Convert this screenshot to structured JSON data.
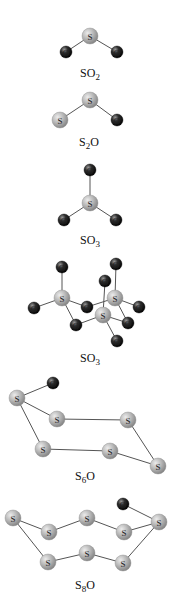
{
  "figure": {
    "width": 171,
    "height": 597,
    "background": "#ffffff",
    "colors": {
      "sulfur_fill": "#b4b4b4",
      "sulfur_highlight": "#e6e6e6",
      "sulfur_shadow": "#8a8a8a",
      "oxygen_fill": "#2a2a2a",
      "oxygen_highlight": "#8a8a8a",
      "oxygen_shadow": "#0a0a0a",
      "bond": "#555555",
      "text": "#111111"
    },
    "atom_radius": {
      "S": 8,
      "O": 6
    }
  },
  "molecules": [
    {
      "id": "so2",
      "label": {
        "main": "SO",
        "sub": "2",
        "tail": "",
        "x": 90,
        "y": 77
      },
      "atoms": [
        {
          "el": "S",
          "x": 90,
          "y": 36
        },
        {
          "el": "O",
          "x": 66,
          "y": 52
        },
        {
          "el": "O",
          "x": 117,
          "y": 52
        }
      ],
      "bonds": [
        [
          0,
          1
        ],
        [
          0,
          2
        ]
      ]
    },
    {
      "id": "s2o",
      "label": {
        "main": "S",
        "sub": "2",
        "tail": "O",
        "x": 89,
        "y": 146
      },
      "atoms": [
        {
          "el": "S",
          "x": 90,
          "y": 100
        },
        {
          "el": "S",
          "x": 60,
          "y": 120
        },
        {
          "el": "O",
          "x": 117,
          "y": 120
        }
      ],
      "bonds": [
        [
          0,
          1
        ],
        [
          0,
          2
        ]
      ]
    },
    {
      "id": "so3-monomer",
      "label": {
        "main": "SO",
        "sub": "3",
        "tail": "",
        "x": 90,
        "y": 244
      },
      "atoms": [
        {
          "el": "S",
          "x": 90,
          "y": 203
        },
        {
          "el": "O",
          "x": 90,
          "y": 170
        },
        {
          "el": "O",
          "x": 64,
          "y": 220
        },
        {
          "el": "O",
          "x": 116,
          "y": 220
        }
      ],
      "bonds": [
        [
          0,
          1
        ],
        [
          0,
          2
        ],
        [
          0,
          3
        ]
      ]
    },
    {
      "id": "so3-trimer",
      "label": {
        "main": "SO",
        "sub": "3",
        "tail": "",
        "x": 90,
        "y": 362
      },
      "atoms": [
        {
          "el": "S",
          "x": 62,
          "y": 298
        },
        {
          "el": "S",
          "x": 115,
          "y": 298
        },
        {
          "el": "S",
          "x": 103,
          "y": 315
        },
        {
          "el": "O",
          "x": 62,
          "y": 267
        },
        {
          "el": "O",
          "x": 116,
          "y": 264
        },
        {
          "el": "O",
          "x": 105,
          "y": 281
        },
        {
          "el": "O",
          "x": 34,
          "y": 308
        },
        {
          "el": "O",
          "x": 139,
          "y": 307
        },
        {
          "el": "O",
          "x": 87,
          "y": 307
        },
        {
          "el": "O",
          "x": 76,
          "y": 325
        },
        {
          "el": "O",
          "x": 128,
          "y": 323
        },
        {
          "el": "O",
          "x": 117,
          "y": 341
        }
      ],
      "bonds": [
        [
          0,
          3
        ],
        [
          1,
          4
        ],
        [
          2,
          5
        ],
        [
          0,
          6
        ],
        [
          1,
          7
        ],
        [
          0,
          8
        ],
        [
          8,
          1
        ],
        [
          0,
          9
        ],
        [
          9,
          2
        ],
        [
          1,
          10
        ],
        [
          2,
          10
        ],
        [
          2,
          11
        ]
      ]
    },
    {
      "id": "s6o",
      "label": {
        "main": "S",
        "sub": "6",
        "tail": "O",
        "x": 85,
        "y": 480
      },
      "atoms": [
        {
          "el": "O",
          "x": 53,
          "y": 383
        },
        {
          "el": "S",
          "x": 17,
          "y": 398
        },
        {
          "el": "S",
          "x": 57,
          "y": 419
        },
        {
          "el": "S",
          "x": 128,
          "y": 420
        },
        {
          "el": "S",
          "x": 43,
          "y": 449
        },
        {
          "el": "S",
          "x": 110,
          "y": 451
        },
        {
          "el": "S",
          "x": 158,
          "y": 466
        }
      ],
      "bonds": [
        [
          0,
          1
        ],
        [
          1,
          2
        ],
        [
          2,
          3
        ],
        [
          3,
          6
        ],
        [
          6,
          5
        ],
        [
          5,
          4
        ],
        [
          4,
          1
        ]
      ]
    },
    {
      "id": "s8o",
      "label": {
        "main": "S",
        "sub": "8",
        "tail": "O",
        "x": 85,
        "y": 589
      },
      "atoms": [
        {
          "el": "O",
          "x": 123,
          "y": 504
        },
        {
          "el": "S",
          "x": 13,
          "y": 518
        },
        {
          "el": "S",
          "x": 49,
          "y": 532
        },
        {
          "el": "S",
          "x": 87,
          "y": 518
        },
        {
          "el": "S",
          "x": 124,
          "y": 532
        },
        {
          "el": "S",
          "x": 159,
          "y": 522
        },
        {
          "el": "S",
          "x": 48,
          "y": 562
        },
        {
          "el": "S",
          "x": 87,
          "y": 553
        },
        {
          "el": "S",
          "x": 123,
          "y": 563
        }
      ],
      "bonds": [
        [
          1,
          2
        ],
        [
          2,
          3
        ],
        [
          3,
          4
        ],
        [
          4,
          5
        ],
        [
          0,
          5
        ],
        [
          5,
          8
        ],
        [
          8,
          7
        ],
        [
          7,
          6
        ],
        [
          6,
          1
        ]
      ]
    }
  ]
}
